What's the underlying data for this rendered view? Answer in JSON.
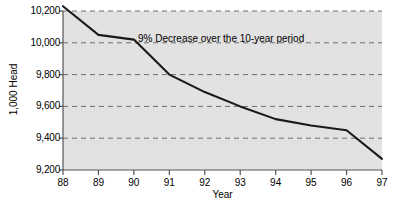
{
  "chart_data": {
    "type": "line",
    "title": "",
    "subtitle": "",
    "xlabel": "Year",
    "ylabel": "1,000 Head",
    "annotation": "9% Decrease over the 10-year period",
    "grid": "horizontal-dashed",
    "legend": "none",
    "background_color": "#e2e2e2",
    "line_color": "#1a1a1a",
    "grid_color": "#6e6e6e",
    "axis_color": "#555555",
    "xlim": [
      88,
      97
    ],
    "ylim": [
      9200,
      10200
    ],
    "x_tick_labels": [
      "88",
      "89",
      "90",
      "91",
      "92",
      "93",
      "94",
      "95",
      "96",
      "97"
    ],
    "y_tick_labels": [
      "9,200",
      "9,400",
      "9,600",
      "9,800",
      "10,000",
      "10,200"
    ],
    "y_ticks": [
      9200,
      9400,
      9600,
      9800,
      10000,
      10200
    ],
    "categories": [
      88,
      89,
      90,
      91,
      92,
      93,
      94,
      95,
      96,
      97
    ],
    "series": [
      {
        "name": "Head",
        "values": [
          10230,
          10050,
          10020,
          9800,
          9690,
          9600,
          9520,
          9480,
          9450,
          9270
        ]
      }
    ]
  },
  "axes": {
    "y_title": "1,000 Head",
    "x_title": "Year"
  }
}
